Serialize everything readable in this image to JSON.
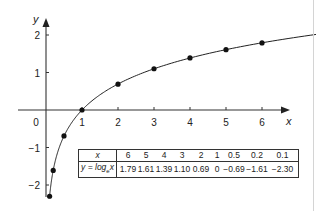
{
  "chart_data": {
    "type": "line",
    "title": "",
    "function": "y = log_e x",
    "xlabel": "x",
    "ylabel": "y",
    "xlim": [
      -0.9,
      7.5
    ],
    "ylim": [
      -2.4,
      2.5
    ],
    "x_ticks": [
      1,
      2,
      3,
      4,
      5,
      6
    ],
    "x_tick_labels": [
      "1",
      "2",
      "3",
      "4",
      "5",
      "6"
    ],
    "y_ticks": [
      -2,
      -1,
      1,
      2
    ],
    "y_tick_labels": [
      "−2",
      "−1",
      "1",
      "2"
    ],
    "origin_label": "0",
    "grid": false,
    "legend": null,
    "points": {
      "x": [
        0.1,
        0.2,
        0.5,
        1,
        2,
        3,
        4,
        5,
        6
      ],
      "y": [
        -2.3,
        -1.61,
        -0.69,
        0,
        0.69,
        1.1,
        1.39,
        1.61,
        1.79
      ]
    },
    "curve": "natural logarithm curve y = ln x from x≈0.1 to x≈7.5",
    "table": {
      "row_headers": [
        "x",
        "y = log_e x"
      ],
      "x_values": [
        "6",
        "5",
        "4",
        "3",
        "2",
        "1",
        "0.5",
        "0.2",
        "0.1"
      ],
      "y_values": [
        "1.79",
        "1.61",
        "1.39",
        "1.10",
        "0.69",
        "0",
        "−0.69",
        "−1.61",
        "−2.30"
      ]
    }
  },
  "labels": {
    "x_axis": "x",
    "y_axis": "y",
    "origin": "0",
    "table_header_x": "x",
    "table_header_y_prefix": "y = log",
    "table_header_y_sub": "e",
    "table_header_y_suffix": "x"
  },
  "colors": {
    "line": "#222222",
    "axis": "#333333",
    "points": "#111111",
    "background": "#ffffff"
  }
}
